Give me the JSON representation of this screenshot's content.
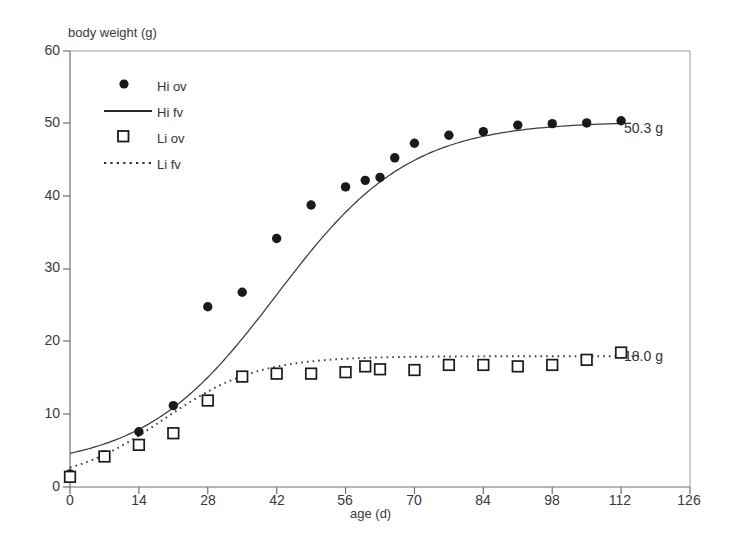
{
  "chart_data": {
    "type": "scatter",
    "title": "",
    "xlabel": "age (d)",
    "ylabel": "body weight (g)",
    "xlim": [
      0,
      126
    ],
    "ylim": [
      0,
      60
    ],
    "xticks": [
      0,
      14,
      28,
      42,
      56,
      70,
      84,
      98,
      112,
      126
    ],
    "yticks": [
      0,
      10,
      20,
      30,
      40,
      50,
      60
    ],
    "grid": false,
    "legend_position": "top-left",
    "series": [
      {
        "name": "Hi ov",
        "marker": "filled-circle",
        "style": "markers",
        "color": "#1a1a1a",
        "x": [
          0,
          7,
          14,
          21,
          28,
          35,
          42,
          49,
          56,
          60,
          63,
          66,
          70,
          77,
          84,
          91,
          98,
          105,
          112
        ],
        "y": [
          1.8,
          4.4,
          7.6,
          11.2,
          24.8,
          26.8,
          34.2,
          38.8,
          41.3,
          42.2,
          42.6,
          45.3,
          47.3,
          48.4,
          48.9,
          49.8,
          50.0,
          50.1,
          50.4
        ]
      },
      {
        "name": "Hi fv",
        "marker": "none",
        "style": "solid-line",
        "color": "#3a3a3a",
        "asymptote": 50.3
      },
      {
        "name": "Li ov",
        "marker": "open-square",
        "style": "markers",
        "color": "#1a1a1a",
        "x": [
          0,
          7,
          14,
          21,
          28,
          35,
          42,
          49,
          56,
          60,
          63,
          70,
          77,
          84,
          91,
          98,
          105,
          112
        ],
        "y": [
          1.4,
          4.2,
          5.8,
          7.4,
          11.9,
          15.2,
          15.6,
          15.6,
          15.8,
          16.6,
          16.2,
          16.1,
          16.8,
          16.8,
          16.6,
          16.8,
          17.5,
          18.5
        ]
      },
      {
        "name": "Li fv",
        "marker": "none",
        "style": "dotted-line",
        "color": "#3a3a3a",
        "asymptote": 18.0
      }
    ],
    "annotations": [
      {
        "text": "50.3 g",
        "x": 114,
        "y": 48.5
      },
      {
        "text": "18.0 g",
        "x": 114,
        "y": 16.3
      }
    ]
  },
  "legend": {
    "items": [
      {
        "label": "Hi ov",
        "marker": "filled-circle"
      },
      {
        "label": "Hi fv",
        "marker": "solid-line"
      },
      {
        "label": "Li ov",
        "marker": "open-square"
      },
      {
        "label": "Li fv",
        "marker": "dotted-line"
      }
    ]
  },
  "colors": {
    "marker": "#1a1a1a",
    "curve": "#3a3a3a",
    "axis": "#8a8a8a",
    "text": "#333333",
    "background": "#ffffff"
  }
}
